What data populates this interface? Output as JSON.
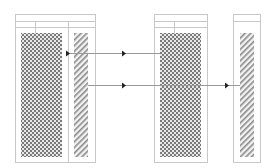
{
  "diagram": {
    "colors": {
      "frame": "#c8c8c8",
      "line": "#9a9a9a",
      "arrow": "#222222",
      "fill_dark": "#7a7a7a",
      "fill_light": "#e8e8e8"
    },
    "frames": [
      {
        "name": "left-frame",
        "x": 15,
        "y": 14,
        "w": 80,
        "h": 148,
        "header_rows": [
          21,
          27
        ],
        "dividers": [
          {
            "x": 35,
            "y1": 21,
            "y2": 33
          },
          {
            "x": 68,
            "y1": 21,
            "y2": 162
          }
        ]
      },
      {
        "name": "middle-frame",
        "x": 154,
        "y": 14,
        "w": 53,
        "h": 148,
        "header_rows": [
          21,
          27
        ],
        "dividers": [
          {
            "x": 174,
            "y1": 21,
            "y2": 33
          }
        ]
      },
      {
        "name": "right-frame",
        "x": 233,
        "y": 14,
        "w": 27,
        "h": 148,
        "header_rows": [
          21
        ],
        "dividers": []
      }
    ],
    "blocks": [
      {
        "name": "left-crosshatch-block",
        "pattern": "checker",
        "x": 21,
        "y": 33,
        "w": 41,
        "h": 124
      },
      {
        "name": "left-hatched-block",
        "pattern": "diagonal",
        "x": 74,
        "y": 33,
        "w": 14,
        "h": 124
      },
      {
        "name": "middle-crosshatch-block",
        "pattern": "checker",
        "x": 160,
        "y": 33,
        "w": 41,
        "h": 124
      },
      {
        "name": "right-hatched-block",
        "pattern": "diagonal",
        "x": 240,
        "y": 33,
        "w": 14,
        "h": 124
      }
    ],
    "connectors": [
      {
        "name": "connector-top",
        "y": 53,
        "x1": 66,
        "x2": 160,
        "arrows": [
          66,
          122
        ]
      },
      {
        "name": "connector-bottom",
        "y": 85,
        "x1": 88,
        "x2": 240,
        "arrows": [
          122,
          225
        ]
      }
    ]
  }
}
